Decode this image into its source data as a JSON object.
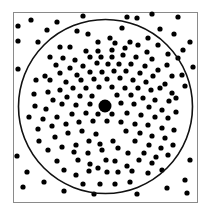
{
  "figure": {
    "colors": {
      "background": "#ffffff",
      "border": "#8a8a8a",
      "circle": "#111111",
      "dot": "#000000"
    },
    "square": {
      "x": 13,
      "y": 12,
      "width": 184,
      "height": 190
    },
    "circle": {
      "cx": 105.5,
      "cy": 106.5,
      "r": 87
    },
    "center_dot": {
      "cx": 105,
      "cy": 106,
      "r": 6.5
    },
    "dot_radius": 2.6,
    "dots": [
      [
        31,
        20
      ],
      [
        18,
        26
      ],
      [
        57,
        22
      ],
      [
        83,
        16
      ],
      [
        127,
        17
      ],
      [
        137,
        18
      ],
      [
        152,
        14
      ],
      [
        178,
        17
      ],
      [
        18,
        41
      ],
      [
        38,
        42
      ],
      [
        47,
        30
      ],
      [
        77,
        31
      ],
      [
        88,
        34
      ],
      [
        122,
        28
      ],
      [
        110,
        38
      ],
      [
        160,
        29
      ],
      [
        174,
        34
      ],
      [
        190,
        42
      ],
      [
        18,
        69
      ],
      [
        193,
        67
      ],
      [
        185,
        86
      ],
      [
        183,
        50
      ],
      [
        98,
        42
      ],
      [
        115,
        43
      ],
      [
        130,
        42
      ],
      [
        148,
        38
      ],
      [
        158,
        45
      ],
      [
        168,
        54
      ],
      [
        178,
        58
      ],
      [
        182,
        75
      ],
      [
        176,
        98
      ],
      [
        60,
        47
      ],
      [
        70,
        47
      ],
      [
        86,
        51
      ],
      [
        98,
        51
      ],
      [
        112,
        50
      ],
      [
        125,
        48
      ],
      [
        138,
        45
      ],
      [
        147,
        52
      ],
      [
        50,
        57
      ],
      [
        63,
        58
      ],
      [
        75,
        60
      ],
      [
        90,
        57
      ],
      [
        101,
        57
      ],
      [
        112,
        57
      ],
      [
        123,
        55
      ],
      [
        136,
        57
      ],
      [
        152,
        59
      ],
      [
        167,
        65
      ],
      [
        56,
        65
      ],
      [
        70,
        68
      ],
      [
        83,
        66
      ],
      [
        97,
        63
      ],
      [
        108,
        64
      ],
      [
        119,
        64
      ],
      [
        131,
        64
      ],
      [
        145,
        66
      ],
      [
        158,
        70
      ],
      [
        172,
        76
      ],
      [
        45,
        76
      ],
      [
        60,
        73
      ],
      [
        77,
        75
      ],
      [
        90,
        72
      ],
      [
        102,
        72
      ],
      [
        114,
        71
      ],
      [
        126,
        71
      ],
      [
        140,
        73
      ],
      [
        153,
        76
      ],
      [
        165,
        84
      ],
      [
        36,
        80
      ],
      [
        50,
        80
      ],
      [
        66,
        82
      ],
      [
        81,
        80
      ],
      [
        94,
        79
      ],
      [
        107,
        79
      ],
      [
        120,
        78
      ],
      [
        133,
        80
      ],
      [
        146,
        82
      ],
      [
        160,
        88
      ],
      [
        48,
        92
      ],
      [
        60,
        90
      ],
      [
        73,
        88
      ],
      [
        86,
        88
      ],
      [
        99,
        87
      ],
      [
        112,
        87
      ],
      [
        125,
        88
      ],
      [
        138,
        88
      ],
      [
        151,
        90
      ],
      [
        172,
        93
      ],
      [
        34,
        94
      ],
      [
        53,
        100
      ],
      [
        67,
        97
      ],
      [
        80,
        96
      ],
      [
        92,
        96
      ],
      [
        117,
        95
      ],
      [
        131,
        95
      ],
      [
        143,
        98
      ],
      [
        155,
        100
      ],
      [
        169,
        101
      ],
      [
        35,
        106
      ],
      [
        46,
        109
      ],
      [
        62,
        104
      ],
      [
        76,
        105
      ],
      [
        90,
        104
      ],
      [
        121,
        103
      ],
      [
        134,
        104
      ],
      [
        149,
        107
      ],
      [
        162,
        110
      ],
      [
        176,
        112
      ],
      [
        29,
        117
      ],
      [
        43,
        119
      ],
      [
        57,
        117
      ],
      [
        72,
        114
      ],
      [
        86,
        113
      ],
      [
        98,
        114
      ],
      [
        112,
        114
      ],
      [
        127,
        113
      ],
      [
        141,
        115
      ],
      [
        155,
        117
      ],
      [
        168,
        118
      ],
      [
        38,
        129
      ],
      [
        52,
        126
      ],
      [
        66,
        124
      ],
      [
        79,
        122
      ],
      [
        93,
        121
      ],
      [
        107,
        121
      ],
      [
        121,
        122
      ],
      [
        135,
        124
      ],
      [
        148,
        125
      ],
      [
        162,
        128
      ],
      [
        174,
        130
      ],
      [
        39,
        141
      ],
      [
        55,
        137
      ],
      [
        68,
        133
      ],
      [
        82,
        131
      ],
      [
        96,
        134
      ],
      [
        113,
        141
      ],
      [
        126,
        131
      ],
      [
        140,
        133
      ],
      [
        152,
        136
      ],
      [
        165,
        138
      ],
      [
        48,
        150
      ],
      [
        62,
        147
      ],
      [
        76,
        145
      ],
      [
        89,
        141
      ],
      [
        100,
        144
      ],
      [
        135,
        141
      ],
      [
        149,
        145
      ],
      [
        161,
        148
      ],
      [
        173,
        145
      ],
      [
        17,
        156
      ],
      [
        57,
        161
      ],
      [
        74,
        152
      ],
      [
        88,
        153
      ],
      [
        102,
        150
      ],
      [
        118,
        148
      ],
      [
        128,
        153
      ],
      [
        144,
        153
      ],
      [
        156,
        157
      ],
      [
        168,
        155
      ],
      [
        64,
        170
      ],
      [
        78,
        160
      ],
      [
        90,
        164
      ],
      [
        106,
        160
      ],
      [
        115,
        161
      ],
      [
        127,
        166
      ],
      [
        139,
        160
      ],
      [
        152,
        163
      ],
      [
        162,
        170
      ],
      [
        27,
        172
      ],
      [
        76,
        175
      ],
      [
        89,
        171
      ],
      [
        98,
        168
      ],
      [
        107,
        172
      ],
      [
        118,
        172
      ],
      [
        132,
        171
      ],
      [
        148,
        173
      ],
      [
        23,
        187
      ],
      [
        44,
        182
      ],
      [
        64,
        191
      ],
      [
        94,
        194
      ],
      [
        137,
        194
      ],
      [
        115,
        184
      ],
      [
        167,
        188
      ],
      [
        185,
        180
      ],
      [
        187,
        193
      ],
      [
        190,
        160
      ],
      [
        83,
        184
      ],
      [
        100,
        184
      ],
      [
        130,
        182
      ]
    ]
  }
}
